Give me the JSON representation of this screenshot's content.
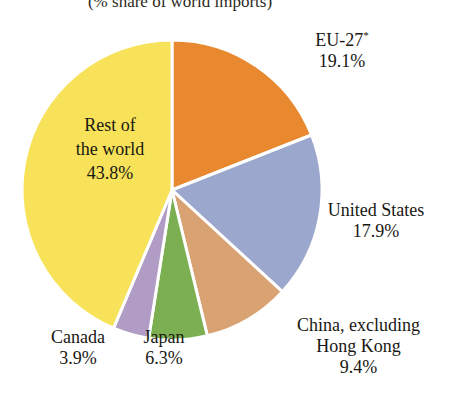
{
  "title": "(% share of world imports)",
  "chart_data": {
    "type": "pie",
    "title": "(% share of world imports)",
    "unit": "% share of world imports",
    "total": 100.4,
    "start_angle_deg": 0,
    "direction": "clockwise",
    "legend": "none (direct labels)",
    "grid": false,
    "categories": [
      "EU-27*",
      "United States",
      "China, excluding Hong Kong",
      "Japan",
      "Canada",
      "Rest of the world"
    ],
    "values": [
      19.1,
      17.9,
      9.4,
      6.3,
      3.9,
      43.8
    ],
    "colors": [
      "#E8892F",
      "#9BA7CC",
      "#D9A273",
      "#7CAE52",
      "#B09CC4",
      "#F7E259"
    ],
    "slices": [
      {
        "key": "eu",
        "name": "EU-27",
        "footnote_marker": "*",
        "value": 19.1,
        "value_label": "19.1%",
        "color": "#E8892F",
        "label_placement": "outside-right"
      },
      {
        "key": "us",
        "name": "United States",
        "value": 17.9,
        "value_label": "17.9%",
        "color": "#9BA7CC",
        "label_placement": "outside-right"
      },
      {
        "key": "china",
        "name_line1": "China, excluding",
        "name_line2": "Hong Kong",
        "name": "China, excluding Hong Kong",
        "value": 9.4,
        "value_label": "9.4%",
        "color": "#D9A273",
        "label_placement": "outside-bottom-right"
      },
      {
        "key": "japan",
        "name": "Japan",
        "value": 6.3,
        "value_label": "6.3%",
        "color": "#7CAE52",
        "label_placement": "outside-bottom"
      },
      {
        "key": "canada",
        "name": "Canada",
        "value": 3.9,
        "value_label": "3.9%",
        "color": "#B09CC4",
        "label_placement": "outside-bottom"
      },
      {
        "key": "rest",
        "name_line1": "Rest of",
        "name_line2": "the world",
        "name": "Rest of the world",
        "value": 43.8,
        "value_label": "43.8%",
        "color": "#F7E259",
        "label_placement": "inside"
      }
    ]
  },
  "geometry": {
    "center_x": 172,
    "center_y": 190,
    "radius": 150,
    "gap_color": "#ffffff"
  }
}
